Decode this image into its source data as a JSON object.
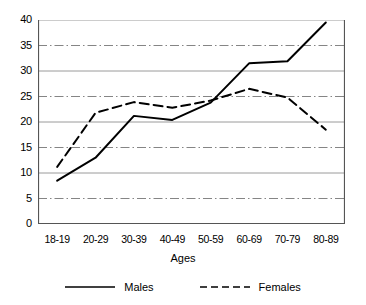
{
  "chart_data": {
    "type": "line",
    "title": "",
    "xlabel": "Ages",
    "ylabel": "",
    "categories": [
      "18-19",
      "20-29",
      "30-39",
      "40-49",
      "50-59",
      "60-69",
      "70-79",
      "80-89"
    ],
    "series": [
      {
        "name": "Males",
        "style": "solid",
        "color": "#000000",
        "values": [
          8.5,
          13.0,
          21.2,
          20.4,
          23.8,
          31.5,
          31.9,
          39.5
        ]
      },
      {
        "name": "Females",
        "style": "dashed",
        "color": "#000000",
        "values": [
          11.2,
          21.8,
          23.9,
          22.8,
          24.2,
          26.5,
          24.8,
          18.5
        ]
      }
    ],
    "ylim": [
      0,
      40
    ],
    "yticks": [
      0,
      5,
      10,
      15,
      20,
      25,
      30,
      35,
      40
    ],
    "ytick_labels": [
      "0",
      "5",
      "10",
      "15",
      "20",
      "25",
      "30",
      "35",
      "40"
    ],
    "grid": true,
    "grid_color": "#9a9a9a",
    "legend_position": "bottom",
    "axis_color": "#555555"
  },
  "legend": {
    "entries": [
      {
        "label": "Males"
      },
      {
        "label": "Females"
      }
    ]
  }
}
